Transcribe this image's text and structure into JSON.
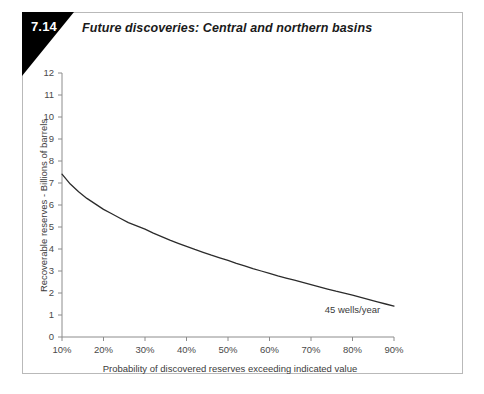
{
  "figure": {
    "number": "7.14",
    "title": "Future discoveries: Central and northern basins"
  },
  "colors": {
    "flag_background": "#000000",
    "flag_text": "#ffffff",
    "border": "#b9b9b9",
    "axis": "#8c8c8c",
    "curve": "#2b2b2b",
    "text": "#3b3b3b",
    "page_background": "#ffffff"
  },
  "chart_data": {
    "type": "line",
    "title": "Future discoveries: Central and northern basins",
    "xlabel": "Probability of discovered reserves exceeding indicated value",
    "ylabel": "Recoverable reserves - Billions of barrels",
    "xlim": [
      10,
      90
    ],
    "ylim": [
      0,
      12
    ],
    "grid": false,
    "legend": "none",
    "x_tick_labels": [
      "10%",
      "20%",
      "30%",
      "40%",
      "50%",
      "60%",
      "70%",
      "80%",
      "90%"
    ],
    "x_tick_values": [
      10,
      20,
      30,
      40,
      50,
      60,
      70,
      80,
      90
    ],
    "y_tick_labels": [
      "0",
      "1",
      "2",
      "3",
      "4",
      "5",
      "6",
      "7",
      "8",
      "9",
      "10",
      "11",
      "12"
    ],
    "y_tick_values": [
      0,
      1,
      2,
      3,
      4,
      5,
      6,
      7,
      8,
      9,
      10,
      11,
      12
    ],
    "series": [
      {
        "name": "Recoverable reserves",
        "x": [
          10,
          12,
          14,
          16,
          18,
          20,
          22,
          24,
          26,
          28,
          30,
          32,
          34,
          36,
          38,
          40,
          42,
          44,
          46,
          48,
          50,
          52,
          54,
          56,
          58,
          60,
          62,
          64,
          66,
          68,
          70,
          72,
          74,
          76,
          78,
          80,
          82,
          84,
          86,
          88,
          90
        ],
        "values": [
          7.4,
          6.95,
          6.6,
          6.3,
          6.05,
          5.8,
          5.6,
          5.4,
          5.2,
          5.05,
          4.9,
          4.72,
          4.56,
          4.4,
          4.26,
          4.12,
          3.98,
          3.85,
          3.72,
          3.6,
          3.48,
          3.35,
          3.23,
          3.11,
          3.0,
          2.89,
          2.78,
          2.68,
          2.58,
          2.48,
          2.38,
          2.28,
          2.18,
          2.08,
          1.99,
          1.9,
          1.8,
          1.7,
          1.6,
          1.5,
          1.4
        ]
      }
    ],
    "annotations": [
      {
        "text": "45 wells/year",
        "x": 80,
        "y": 1.1
      }
    ]
  }
}
